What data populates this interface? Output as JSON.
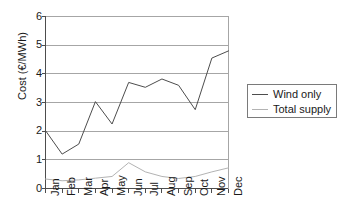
{
  "chart_data": {
    "type": "line",
    "title": "",
    "xlabel": "",
    "ylabel": "Cost (€/MWh)",
    "categories": [
      "Jan",
      "Feb",
      "Mar",
      "Apr",
      "May",
      "Jun",
      "Jul",
      "Aug",
      "Sep",
      "Oct",
      "Nov",
      "Dec"
    ],
    "ylim": [
      0,
      6
    ],
    "yticks": [
      0,
      1,
      2,
      3,
      4,
      5,
      6
    ],
    "ytick_labels": [
      "0",
      "1",
      "2",
      "3",
      "4",
      "5",
      "6"
    ],
    "grid": "horizontal",
    "legend_position": "right",
    "series": [
      {
        "name": "Wind only",
        "color": "#4d4d4d",
        "values": [
          2.02,
          1.2,
          1.55,
          3.03,
          2.25,
          3.7,
          3.53,
          3.82,
          3.6,
          2.75,
          4.55,
          4.8
        ]
      },
      {
        "name": "Total supply",
        "color": "#b3b3b3",
        "values": [
          0.33,
          0.27,
          0.3,
          0.36,
          0.42,
          0.9,
          0.58,
          0.42,
          0.35,
          0.42,
          0.58,
          0.72
        ]
      }
    ]
  },
  "legend": {
    "items": [
      {
        "label": "Wind only"
      },
      {
        "label": "Total supply"
      }
    ]
  },
  "colors": {
    "wind_only": "#4d4d4d",
    "total_supply": "#b3b3b3",
    "axis": "#4d4d4d",
    "grid": "#a6a6a6",
    "background": "#ffffff"
  }
}
